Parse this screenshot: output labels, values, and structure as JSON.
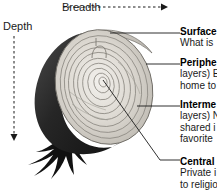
{
  "diagram": {
    "axes": {
      "breadth": {
        "label": "Breadth",
        "direction": "horizontal-right",
        "style": "dashed-arrow"
      },
      "depth": {
        "label": "Depth",
        "direction": "vertical-down",
        "style": "dashed-arrow"
      }
    },
    "colors": {
      "outline": "#1a1a1a",
      "shadow_half": "#2b2b2b",
      "cut_face_light": "#e8e6e1",
      "cut_face_mid": "#c9c6bf",
      "ring_line": "#8e8b84",
      "roots": "#111111",
      "text": "#1a1a1a",
      "leader_line": "#1a1a1a",
      "background": "#ffffff"
    },
    "onion": {
      "name": "cut-onion-illustration",
      "parts": [
        "outer-skin",
        "concentric-layers",
        "core",
        "roots",
        "shadowed-back-half"
      ]
    },
    "labels": [
      {
        "id": "surface",
        "title": "Surface",
        "lines": [
          "What is"
        ],
        "leader_from": "outer edge of cut face",
        "truncated": true
      },
      {
        "id": "peripheral",
        "title": "Periphe",
        "lines": [
          "layers) E",
          "home to"
        ],
        "leader_from": "outer ring of cut face",
        "truncated": true
      },
      {
        "id": "intermediate",
        "title": "Interme",
        "lines": [
          "layers) N",
          "shared i",
          "favorite"
        ],
        "leader_from": "middle ring of cut face",
        "truncated": true
      },
      {
        "id": "central",
        "title": "Central",
        "lines": [
          "Private i",
          "to religio"
        ],
        "leader_from": "core of onion",
        "truncated": true
      }
    ]
  }
}
